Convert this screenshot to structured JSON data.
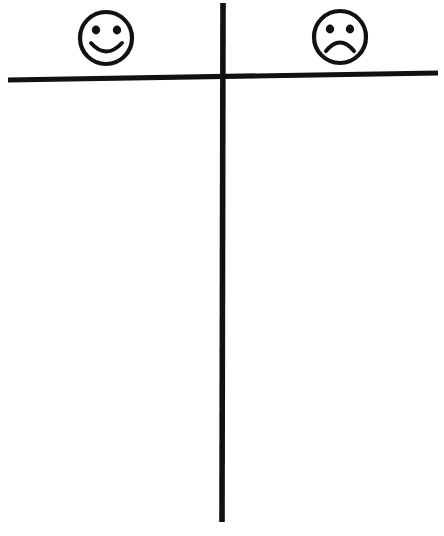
{
  "document": {
    "title": "T-Chart Graphic Organizer",
    "kind": "hand-drawn-t-chart",
    "background_color": "#ffffff",
    "ink_color": "#111111",
    "width": 444,
    "height": 536
  },
  "chart_data": {
    "type": "table",
    "title": "",
    "subtitle": "",
    "xlabel": "",
    "ylabel": "",
    "grid": false,
    "legend_position": "none",
    "columns": [
      {
        "id": "positive",
        "header_icon": "smiley-face-icon",
        "header_label": "",
        "sentiment": "positive",
        "entries": []
      },
      {
        "id": "negative",
        "header_icon": "sad-face-icon",
        "header_label": "",
        "sentiment": "negative",
        "entries": []
      }
    ]
  },
  "layout": {
    "horizontal_rule": {
      "x1": 8,
      "y1": 80,
      "x2": 438,
      "y2": 73,
      "thickness": 5.2
    },
    "vertical_rule": {
      "x1": 223,
      "y1": 3,
      "x2": 222,
      "y2": 522,
      "thickness": 5.6
    },
    "smiley": {
      "cx": 106,
      "cy": 38,
      "r": 26,
      "eye_left_cx": 96,
      "eye_right_cx": 117,
      "eye_cy": 30,
      "eye_rx": 4.2,
      "eye_ry": 4.4,
      "mouth_path": "M 91 43 Q 106 60 122 43"
    },
    "sad": {
      "cx": 340,
      "cy": 37,
      "r": 26,
      "eye_left_cx": 330,
      "eye_right_cx": 350,
      "eye_cy": 29,
      "eye_rx": 4.2,
      "eye_ry": 4.4,
      "mouth_path": "M 326 51 Q 340 34 354 51"
    }
  }
}
